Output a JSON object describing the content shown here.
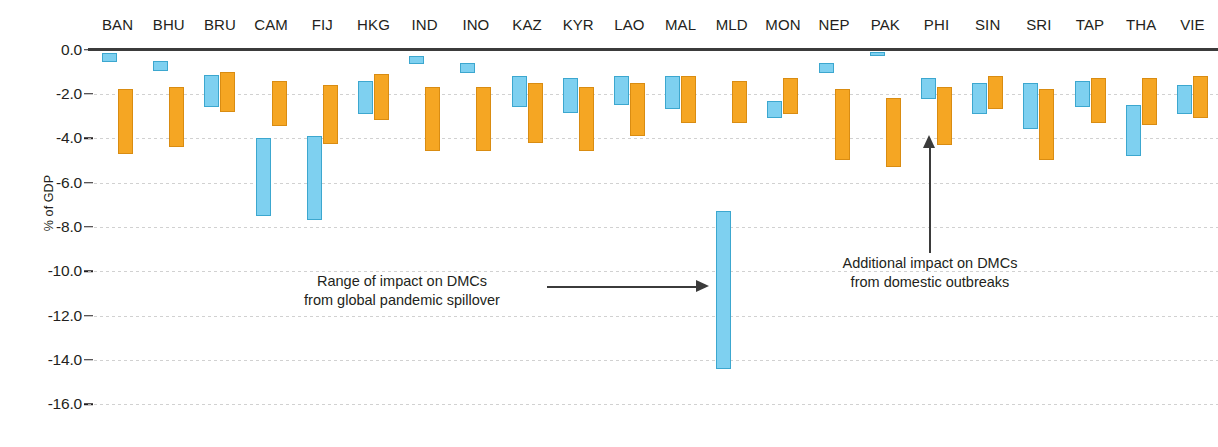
{
  "chart_data": {
    "type": "bar",
    "title": "",
    "subtitle": "",
    "xlabel": "",
    "ylabel": "% of GDP",
    "ylim": [
      -16.0,
      0.0
    ],
    "grid": true,
    "legend_position": "none",
    "orientation": "vertical",
    "bar_style": "floating range bars (each bar spans from a start value to an end value)",
    "colors": {
      "blue": "#7ed0f0",
      "orange": "#f5a623",
      "axis": "#3b3b3b",
      "grid": "#c9c9c9",
      "text": "#231f20"
    },
    "ytick_labels": [
      "0.0",
      "-2.0",
      "-4.0",
      "-6.0",
      "-8.0",
      "-10.0",
      "-12.0",
      "-14.0",
      "-16.0"
    ],
    "ytick_values": [
      0.0,
      -2.0,
      -4.0,
      -6.0,
      -8.0,
      -10.0,
      -12.0,
      -14.0,
      -16.0
    ],
    "categories": [
      "BAN",
      "BHU",
      "BRU",
      "CAM",
      "FIJ",
      "HKG",
      "IND",
      "INO",
      "KAZ",
      "KYR",
      "LAO",
      "MAL",
      "MLD",
      "MON",
      "NEP",
      "PAK",
      "PHI",
      "SIN",
      "SRI",
      "TAP",
      "THA",
      "VIE"
    ],
    "series": [
      {
        "name": "Additional impact on DMCs from domestic outbreaks",
        "color": "#7ed0f0",
        "ranges": [
          [
            -0.15,
            -0.55
          ],
          [
            -0.5,
            -0.95
          ],
          [
            -1.15,
            -2.6
          ],
          [
            -4.0,
            -7.5
          ],
          [
            -3.9,
            -7.7
          ],
          [
            -1.4,
            -2.9
          ],
          [
            -0.3,
            -0.65
          ],
          [
            -0.6,
            -1.05
          ],
          [
            -1.2,
            -2.6
          ],
          [
            -1.3,
            -2.85
          ],
          [
            -1.2,
            -2.5
          ],
          [
            -1.2,
            -2.7
          ],
          [
            -7.3,
            -14.4
          ],
          [
            -2.3,
            -3.1
          ],
          [
            -0.6,
            -1.05
          ],
          [
            -0.1,
            -0.3
          ],
          [
            -1.3,
            -2.25
          ],
          [
            -1.5,
            -2.9
          ],
          [
            -1.5,
            -3.6
          ],
          [
            -1.4,
            -2.6
          ],
          [
            -2.5,
            -4.8
          ],
          [
            -1.6,
            -2.9
          ]
        ]
      },
      {
        "name": "Range of impact on DMCs from global pandemic spillover",
        "color": "#f5a623",
        "ranges": [
          [
            -1.8,
            -4.7
          ],
          [
            -1.7,
            -4.4
          ],
          [
            -1.0,
            -2.8
          ],
          [
            -1.4,
            -3.45
          ],
          [
            -1.6,
            -4.25
          ],
          [
            -1.1,
            -3.2
          ],
          [
            -1.7,
            -4.6
          ],
          [
            -1.7,
            -4.6
          ],
          [
            -1.5,
            -4.2
          ],
          [
            -1.7,
            -4.6
          ],
          [
            -1.5,
            -3.9
          ],
          [
            -1.2,
            -3.3
          ],
          [
            -1.4,
            -3.3
          ],
          [
            -1.3,
            -2.9
          ],
          [
            -1.8,
            -5.0
          ],
          [
            -2.2,
            -5.3
          ],
          [
            -1.7,
            -4.3
          ],
          [
            -1.2,
            -2.7
          ],
          [
            -1.8,
            -5.0
          ],
          [
            -1.3,
            -3.3
          ],
          [
            -1.3,
            -3.4
          ],
          [
            -1.2,
            -3.1
          ]
        ]
      }
    ],
    "annotations": [
      {
        "id": "spillover",
        "line1": "Range of impact on DMCs",
        "line2": "from global pandemic spillover",
        "points_to": "MLD blue bar",
        "arrow": "right"
      },
      {
        "id": "domestic",
        "line1": "Additional impact on DMCs",
        "line2": "from domestic outbreaks",
        "points_to": "PHI orange bar",
        "arrow": "up"
      }
    ]
  }
}
